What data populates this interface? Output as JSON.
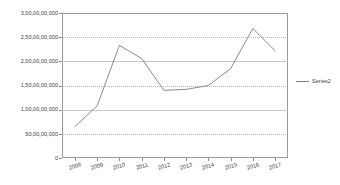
{
  "chart_data": {
    "type": "line",
    "title": "",
    "xlabel": "",
    "ylabel": "",
    "categories": [
      "2008",
      "2009",
      "2010",
      "2011",
      "2012",
      "2013",
      "2014",
      "2015",
      "2016",
      "2017"
    ],
    "series": [
      {
        "name": "Series2",
        "values": [
          650000000,
          1080000000,
          2330000000,
          2060000000,
          1400000000,
          1420000000,
          1500000000,
          1850000000,
          2680000000,
          2220000000
        ]
      }
    ],
    "ylim": [
      0,
      3000000000
    ],
    "ytick_values": [
      0,
      500000000,
      1000000000,
      1500000000,
      2000000000,
      2500000000,
      3000000000
    ],
    "ytick_labels": [
      "0",
      "50,00,00,000",
      "1,00,00,00,000",
      "1,50,00,00,000",
      "2,00,00,00,000",
      "2,50,00,00,000",
      "3,00,00,00,000"
    ],
    "grid": true,
    "legend_position": "right",
    "line_color": "#7d7d7d",
    "grid_color": "#c8c8c8",
    "axis_color": "#9a9a9a"
  },
  "legend": {
    "entries": [
      {
        "label": "Series2"
      }
    ]
  }
}
